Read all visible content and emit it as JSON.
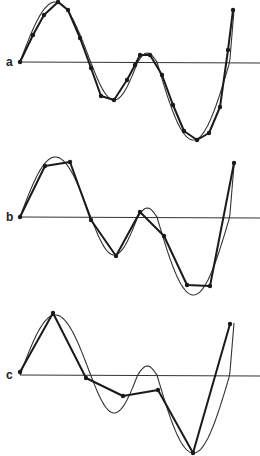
{
  "figure": {
    "panels": [
      {
        "label": "a",
        "axis_y": 62,
        "caption": "dense sampling",
        "samples": [
          [
            20,
            62
          ],
          [
            33,
            35
          ],
          [
            44,
            15
          ],
          [
            58,
            2
          ],
          [
            68,
            10
          ],
          [
            80,
            38
          ],
          [
            91,
            68
          ],
          [
            101,
            96
          ],
          [
            114,
            100
          ],
          [
            127,
            80
          ],
          [
            135,
            65
          ],
          [
            140,
            55
          ],
          [
            150,
            55
          ],
          [
            162,
            75
          ],
          [
            173,
            105
          ],
          [
            184,
            131
          ],
          [
            197,
            140
          ],
          [
            209,
            133
          ],
          [
            220,
            107
          ],
          [
            228,
            50
          ],
          [
            233,
            10
          ]
        ]
      },
      {
        "label": "b",
        "axis_y": 217,
        "caption": "medium sampling",
        "samples": [
          [
            20,
            217
          ],
          [
            45,
            166
          ],
          [
            70,
            162
          ],
          [
            91,
            220
          ],
          [
            116,
            256
          ],
          [
            140,
            212
          ],
          [
            164,
            236
          ],
          [
            187,
            285
          ],
          [
            210,
            286
          ],
          [
            234,
            163
          ]
        ]
      },
      {
        "label": "c",
        "axis_y": 375,
        "caption": "sparse sampling",
        "samples": [
          [
            20,
            372
          ],
          [
            53,
            313
          ],
          [
            86,
            378
          ],
          [
            123,
            396
          ],
          [
            158,
            390
          ],
          [
            193,
            453
          ],
          [
            230,
            324
          ]
        ]
      }
    ],
    "wave_color": "#333333",
    "sample_line_color": "#1a1a1a",
    "background": "#ffffff"
  }
}
